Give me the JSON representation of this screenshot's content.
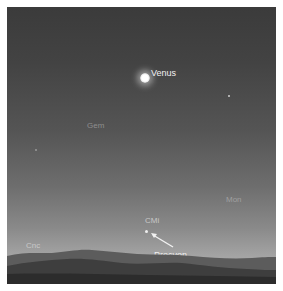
{
  "scene": {
    "type": "twilight sky chart",
    "colors": {
      "sky_top": "#3b3b3b",
      "sky_horizon": "#b0b0b0",
      "hills_far": "#5a5a5a",
      "hills_near": "#333333",
      "label_bright": "#f2f2f2",
      "label_dim": "#8e8e8e"
    }
  },
  "labels": {
    "venus": "Venus",
    "gem": "Gem",
    "mon": "Mon",
    "cmi": "CMi",
    "cnc": "Cnc",
    "procyon": "Procyon"
  },
  "objects": [
    {
      "name": "Venus",
      "kind": "planet",
      "x": 146,
      "y": 78
    },
    {
      "name": "Procyon",
      "kind": "star",
      "x": 145,
      "y": 230
    },
    {
      "name": "star-right",
      "kind": "star",
      "x": 229,
      "y": 95
    },
    {
      "name": "star-left",
      "kind": "star",
      "x": 35,
      "y": 149
    }
  ]
}
